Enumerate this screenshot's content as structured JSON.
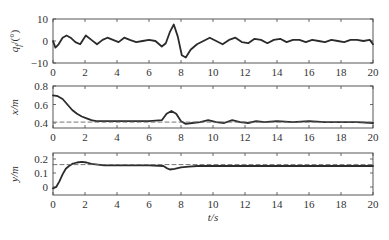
{
  "chart_data": [
    {
      "type": "line",
      "panel": "top",
      "ylabel": "q_f/(°)",
      "xlabel": "",
      "xlim": [
        0,
        20
      ],
      "ylim": [
        -10,
        10
      ],
      "xticks": [
        0,
        2,
        4,
        6,
        8,
        10,
        12,
        14,
        16,
        18,
        20
      ],
      "yticks": [
        -10,
        0,
        10
      ],
      "grid": false,
      "series": [
        {
          "name": "q_f",
          "style": "solid",
          "x": [
            0,
            0.15,
            0.35,
            0.6,
            0.85,
            1.1,
            1.4,
            1.7,
            2.05,
            2.4,
            2.75,
            3.1,
            3.4,
            3.75,
            4.1,
            4.45,
            4.8,
            5.2,
            5.6,
            6.0,
            6.4,
            6.8,
            7.05,
            7.3,
            7.55,
            7.8,
            8.05,
            8.3,
            8.6,
            9.0,
            9.4,
            9.8,
            10.2,
            10.6,
            11.0,
            11.4,
            11.8,
            12.2,
            12.6,
            13.0,
            13.4,
            13.8,
            14.2,
            14.6,
            15.0,
            15.4,
            15.8,
            16.2,
            16.6,
            17.0,
            17.4,
            17.8,
            18.2,
            18.6,
            19.0,
            19.4,
            19.8,
            20
          ],
          "y": [
            0,
            -3,
            -1.5,
            1.5,
            2.5,
            1.5,
            -0.5,
            -1.5,
            2.5,
            0.5,
            -1.5,
            0.5,
            1.5,
            0.5,
            -0.5,
            1.5,
            0.5,
            -0.5,
            0,
            0.5,
            0,
            -2.5,
            -1,
            4,
            7.5,
            2,
            -6.5,
            -7.5,
            -4,
            -1.5,
            0,
            1.5,
            0,
            -1.5,
            0.5,
            1.5,
            -0.5,
            -1,
            1,
            0.5,
            -1,
            0.5,
            1,
            -0.5,
            0.5,
            0.5,
            -0.5,
            0.5,
            0,
            -0.5,
            0.5,
            0,
            -0.5,
            0.5,
            0.5,
            0,
            0.5,
            -1.5
          ]
        }
      ]
    },
    {
      "type": "line",
      "panel": "middle",
      "ylabel": "x/m",
      "xlabel": "",
      "xlim": [
        0,
        20
      ],
      "ylim": [
        0.35,
        0.8
      ],
      "xticks": [
        0,
        2,
        4,
        6,
        8,
        10,
        12,
        14,
        16,
        18,
        20
      ],
      "yticks": [
        0.4,
        0.6,
        0.8
      ],
      "grid": false,
      "series": [
        {
          "name": "x (actual)",
          "style": "solid",
          "x": [
            0,
            0.3,
            0.6,
            0.9,
            1.2,
            1.5,
            1.8,
            2.1,
            2.4,
            2.7,
            3.0,
            3.5,
            4.0,
            5.0,
            6.0,
            6.8,
            7.1,
            7.4,
            7.7,
            8.0,
            8.3,
            8.7,
            9.2,
            9.7,
            10.2,
            10.7,
            11.2,
            11.7,
            12.2,
            12.7,
            13.2,
            14.0,
            15.0,
            16.0,
            17.0,
            18.0,
            19.0,
            20
          ],
          "y": [
            0.7,
            0.69,
            0.66,
            0.6,
            0.54,
            0.5,
            0.47,
            0.45,
            0.43,
            0.42,
            0.42,
            0.42,
            0.42,
            0.42,
            0.42,
            0.43,
            0.5,
            0.53,
            0.5,
            0.42,
            0.39,
            0.4,
            0.41,
            0.43,
            0.41,
            0.4,
            0.43,
            0.41,
            0.4,
            0.42,
            0.41,
            0.42,
            0.41,
            0.42,
            0.41,
            0.41,
            0.41,
            0.4
          ]
        },
        {
          "name": "x (reference)",
          "style": "dashed",
          "x": [
            0,
            20
          ],
          "y": [
            0.41,
            0.41
          ]
        }
      ]
    },
    {
      "type": "line",
      "panel": "bottom",
      "ylabel": "y/m",
      "xlabel": "t/s",
      "xlim": [
        0,
        20
      ],
      "ylim": [
        -0.05,
        0.24
      ],
      "xticks": [
        0,
        2,
        4,
        6,
        8,
        10,
        12,
        14,
        16,
        18,
        20
      ],
      "yticks": [
        0,
        0.1,
        0.2
      ],
      "grid": false,
      "series": [
        {
          "name": "y (actual)",
          "style": "solid",
          "x": [
            0,
            0.2,
            0.4,
            0.6,
            0.8,
            1.0,
            1.2,
            1.5,
            1.8,
            2.1,
            2.4,
            2.8,
            3.2,
            4.0,
            5.0,
            6.0,
            6.9,
            7.1,
            7.3,
            7.6,
            8.0,
            8.5,
            9.0,
            10.0,
            12.0,
            14.0,
            16.0,
            18.0,
            20
          ],
          "y": [
            -0.01,
            0.0,
            0.04,
            0.09,
            0.13,
            0.15,
            0.165,
            0.175,
            0.18,
            0.175,
            0.165,
            0.16,
            0.155,
            0.155,
            0.155,
            0.155,
            0.15,
            0.135,
            0.125,
            0.13,
            0.14,
            0.145,
            0.15,
            0.15,
            0.15,
            0.15,
            0.15,
            0.15,
            0.15
          ]
        },
        {
          "name": "y (reference)",
          "style": "dashed",
          "x": [
            0,
            20
          ],
          "y": [
            0.16,
            0.16
          ]
        }
      ]
    }
  ],
  "labels": {
    "panel_top_ylabel_main": "q",
    "panel_top_ylabel_sub": "f",
    "panel_top_ylabel_unit": "/(°)",
    "panel_middle_ylabel": "x/m",
    "panel_bottom_ylabel": "y/m",
    "xlabel": "t/s",
    "top_yticks": [
      "10",
      "0",
      "−10"
    ],
    "middle_yticks": [
      "0.8",
      "0.6",
      "0.4"
    ],
    "bottom_yticks": [
      "0.2",
      "0.1",
      "0"
    ],
    "xticks": [
      "0",
      "2",
      "4",
      "6",
      "8",
      "10",
      "12",
      "14",
      "16",
      "18",
      "20"
    ]
  },
  "colors": {
    "line": "#2b2b2b",
    "dashed": "#666666",
    "axes": "#444444",
    "text": "#333333"
  }
}
